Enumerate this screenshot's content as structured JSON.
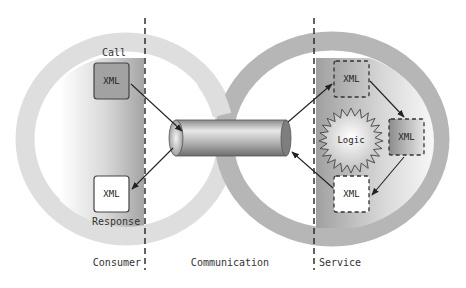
{
  "diagram": {
    "zones": {
      "consumer": "Consumer",
      "communication": "Communication",
      "service": "Service"
    },
    "consumer": {
      "call_label": "Call",
      "response_label": "Response",
      "call_box": "XML",
      "response_box": "XML"
    },
    "service": {
      "logic_label": "Logic",
      "in_box": "XML",
      "process_box": "XML",
      "out_box": "XML"
    },
    "colors": {
      "left_ring": "#dcdcdc",
      "right_ring": "#b4b4b4",
      "panel_dark": "#a8a8a8",
      "box_fill": "#a0a0a0",
      "divider": "#222222"
    }
  }
}
